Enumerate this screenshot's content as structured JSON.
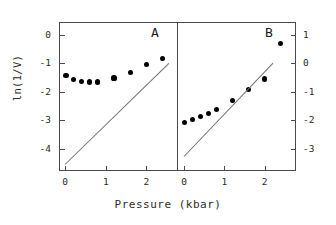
{
  "figure": {
    "xlabel": "Pressure (kbar)",
    "ylabel": "ln(1/V)",
    "panel_a_letter": "A",
    "panel_b_letter": "B",
    "line_color": "#6e6e6e",
    "marker_color": "#000000",
    "axis_color": "#4a4a4a"
  },
  "chart_data": [
    {
      "type": "scatter",
      "title": "A",
      "panel": "A",
      "xlabel": "Pressure (kbar)",
      "ylabel": "ln(1/V)",
      "xlim": [
        -0.15,
        2.75
      ],
      "ylim": [
        -4.75,
        0.45
      ],
      "xticks": [
        0,
        1,
        2
      ],
      "xticklabels": [
        "0",
        "1",
        "2"
      ],
      "yticks": [
        0,
        -1,
        -2,
        -3,
        -4
      ],
      "yticklabels": [
        "0",
        "-1",
        "-2",
        "-3",
        "-4"
      ],
      "yaxis_side": "left",
      "grid": false,
      "legend": false,
      "series": [
        {
          "name": "measured",
          "marker": "filled-circle",
          "x": [
            0.02,
            0.2,
            0.4,
            0.6,
            0.8,
            1.2,
            1.6,
            2.0,
            2.4
          ],
          "y": [
            -1.42,
            -1.57,
            -1.64,
            -1.66,
            -1.66,
            -1.52,
            -1.33,
            -1.05,
            -0.82
          ]
        },
        {
          "name": "fit-line",
          "marker": "line",
          "x": [
            0.0,
            2.55
          ],
          "y": [
            -4.55,
            -1.0
          ]
        }
      ]
    },
    {
      "type": "scatter",
      "title": "B",
      "panel": "B",
      "xlabel": "Pressure (kbar)",
      "ylabel": "ln(1/V)",
      "xlim": [
        -0.15,
        2.75
      ],
      "ylim": [
        -3.75,
        1.45
      ],
      "xticks": [
        0,
        1,
        2
      ],
      "xticklabels": [
        "0",
        "1",
        "2"
      ],
      "yticks": [
        1,
        0,
        -1,
        -2,
        -3
      ],
      "yticklabels": [
        "1",
        "0",
        "-1",
        "-2",
        "-3"
      ],
      "yaxis_side": "right",
      "grid": false,
      "legend": false,
      "series": [
        {
          "name": "measured",
          "marker": "filled-circle",
          "x": [
            0.02,
            0.2,
            0.4,
            0.6,
            0.8,
            1.2,
            1.6,
            2.0,
            2.4
          ],
          "y": [
            -2.07,
            -1.97,
            -1.86,
            -1.76,
            -1.62,
            -1.31,
            -0.93,
            -0.55,
            0.7
          ]
        },
        {
          "name": "fit-line",
          "marker": "line",
          "x": [
            0.0,
            2.2
          ],
          "y": [
            -3.25,
            0.02
          ]
        }
      ]
    }
  ]
}
